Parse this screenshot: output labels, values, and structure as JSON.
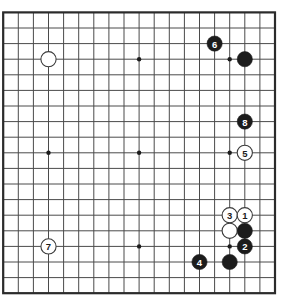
{
  "diagram": {
    "board_size": 19,
    "geometry": {
      "origin_x": 3.2,
      "origin_y": 12.4,
      "step_x": 15.1,
      "step_y": 15.6,
      "stone_radius": 7.6,
      "border_width": 2.2,
      "line_width": 1.0,
      "star_radius": 2.2
    },
    "colors": {
      "background": "#ffffff",
      "board_line": "#4a4a4a",
      "board_border": "#2b2b2b",
      "black_stone": "#1c1c1c",
      "white_stone": "#ffffff",
      "white_stone_edge": "#3a3a3a",
      "black_label_text": "#ffffff",
      "white_label_text": "#1c1c1c",
      "star_point": "#1c1c1c"
    },
    "star_points": [
      {
        "col": 3,
        "row": 3
      },
      {
        "col": 9,
        "row": 3
      },
      {
        "col": 15,
        "row": 3
      },
      {
        "col": 3,
        "row": 9
      },
      {
        "col": 9,
        "row": 9
      },
      {
        "col": 15,
        "row": 9
      },
      {
        "col": 3,
        "row": 15
      },
      {
        "col": 9,
        "row": 15
      },
      {
        "col": 15,
        "row": 15
      }
    ],
    "stones": [
      {
        "id": "stone-white-upper-left",
        "col": 3,
        "row": 3,
        "color": "white",
        "label": ""
      },
      {
        "id": "stone-black-6",
        "col": 14,
        "row": 2,
        "color": "black",
        "label": "6"
      },
      {
        "id": "stone-black-upper-right",
        "col": 16,
        "row": 3,
        "color": "black",
        "label": ""
      },
      {
        "id": "stone-black-8",
        "col": 16,
        "row": 7,
        "color": "black",
        "label": "8"
      },
      {
        "id": "stone-white-5",
        "col": 16,
        "row": 9,
        "color": "white",
        "label": "5"
      },
      {
        "id": "stone-white-3",
        "col": 15,
        "row": 13,
        "color": "white",
        "label": "3"
      },
      {
        "id": "stone-white-1",
        "col": 16,
        "row": 13,
        "color": "white",
        "label": "1"
      },
      {
        "id": "stone-white-lower-right",
        "col": 15,
        "row": 14,
        "color": "white",
        "label": ""
      },
      {
        "id": "stone-black-lower-right",
        "col": 16,
        "row": 14,
        "color": "black",
        "label": ""
      },
      {
        "id": "stone-black-2",
        "col": 16,
        "row": 15,
        "color": "black",
        "label": "2"
      },
      {
        "id": "stone-white-7",
        "col": 3,
        "row": 15,
        "color": "white",
        "label": "7"
      },
      {
        "id": "stone-black-4",
        "col": 13,
        "row": 16,
        "color": "black",
        "label": "4"
      },
      {
        "id": "stone-black-lower-center",
        "col": 15,
        "row": 16,
        "color": "black",
        "label": ""
      }
    ]
  }
}
